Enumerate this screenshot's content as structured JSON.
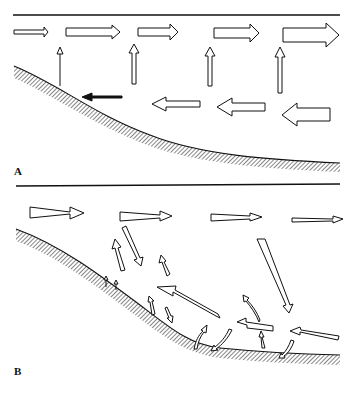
{
  "figure": {
    "panels": [
      {
        "id": "A",
        "label": "A",
        "description": "Uniform horizontal flow above, rising flow, and reversed near-bed flow over a sloping bed"
      },
      {
        "id": "B",
        "label": "B",
        "description": "Tapering horizontal arrows above, with eddying/recirculating flow arrows near the sloping bed"
      }
    ],
    "colors": {
      "ink": "#111111",
      "background": "#ffffff",
      "hatch": "#222222"
    }
  }
}
